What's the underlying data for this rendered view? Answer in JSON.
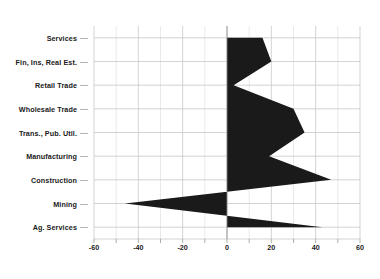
{
  "chart_data": {
    "type": "area",
    "title": "",
    "xlabel": "",
    "ylabel": "",
    "orientation": "horizontal",
    "categories": [
      "Services",
      "Fin, Ins, Real Est.",
      "Retail Trade",
      "Wholesale Trade",
      "Trans., Pub. Util.",
      "Manufacturing",
      "Construction",
      "Mining",
      "Ag. Services"
    ],
    "values": [
      16,
      20,
      3,
      30,
      35,
      19,
      47,
      -46,
      43
    ],
    "xlim": [
      -60,
      60
    ],
    "xticks": [
      -60,
      -40,
      -20,
      0,
      20,
      40,
      60
    ],
    "xticklabels": [
      "-60",
      "-40",
      "-20",
      "0",
      "20",
      "40",
      "60"
    ],
    "minor_tick_step": 10,
    "grid": true,
    "legend": "none",
    "fill_color": "#1a1a1a",
    "grid_color": "#c8c8c8",
    "zero_line_color": "#8c8c8c",
    "background_color": "#ffffff"
  }
}
